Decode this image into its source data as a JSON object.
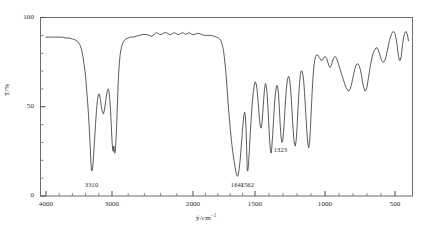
{
  "figure": {
    "type": "ir-spectrum",
    "background": "#ffffff",
    "line_color": "#4a4a4a"
  },
  "axes": {
    "y_title": "T/%",
    "x_title_symbol": "ỹ/cm",
    "x_title_exponent": "−1",
    "x_ticks": [
      "4000",
      "3000",
      "2000",
      "1500",
      "1000",
      "500"
    ],
    "y_ticks": [
      "100",
      "50",
      "0"
    ]
  },
  "peak_labels": [
    {
      "text": "3310"
    },
    {
      "text": "1641"
    },
    {
      "text": "1562"
    },
    {
      "text": "1323"
    }
  ],
  "chart_data": {
    "type": "line",
    "title": "",
    "xlabel": "ỹ/cm⁻¹",
    "ylabel": "T/%",
    "xlim": [
      4000,
      400
    ],
    "ylim": [
      0,
      100
    ],
    "grid": false,
    "legend": null,
    "x_axis_scale": "piecewise-linear (compressed above 2000 cm-1)",
    "x_axis_breakpoints": [
      {
        "wavenumber": 4000,
        "px": 46
      },
      {
        "wavenumber": 3000,
        "px": 112
      },
      {
        "wavenumber": 2000,
        "px": 193
      },
      {
        "wavenumber": 1500,
        "px": 255
      },
      {
        "wavenumber": 1000,
        "px": 325
      },
      {
        "wavenumber": 500,
        "px": 395
      }
    ],
    "annotations": [
      {
        "label": "3310",
        "wavenumber": 3310,
        "transmittance": 14
      },
      {
        "label": "1641",
        "wavenumber": 1641,
        "transmittance": 11
      },
      {
        "label": "1562",
        "wavenumber": 1562,
        "transmittance": 14
      },
      {
        "label": "1323",
        "wavenumber": 1323,
        "transmittance": 30
      }
    ],
    "series": [
      {
        "name": "transmittance",
        "points": [
          [
            4000,
            89
          ],
          [
            3960,
            89
          ],
          [
            3900,
            89
          ],
          [
            3850,
            89
          ],
          [
            3800,
            89
          ],
          [
            3750,
            89
          ],
          [
            3700,
            88.5
          ],
          [
            3650,
            88.5
          ],
          [
            3600,
            88
          ],
          [
            3560,
            87.5
          ],
          [
            3520,
            86.5
          ],
          [
            3490,
            85
          ],
          [
            3460,
            82
          ],
          [
            3440,
            78
          ],
          [
            3420,
            73
          ],
          [
            3400,
            67
          ],
          [
            3385,
            60
          ],
          [
            3370,
            53
          ],
          [
            3355,
            45
          ],
          [
            3340,
            35
          ],
          [
            3328,
            26
          ],
          [
            3318,
            18
          ],
          [
            3310,
            14
          ],
          [
            3300,
            14.5
          ],
          [
            3290,
            17
          ],
          [
            3278,
            23
          ],
          [
            3265,
            31
          ],
          [
            3250,
            40
          ],
          [
            3235,
            48
          ],
          [
            3220,
            54
          ],
          [
            3205,
            57
          ],
          [
            3190,
            57
          ],
          [
            3175,
            54
          ],
          [
            3160,
            50
          ],
          [
            3145,
            47
          ],
          [
            3130,
            46
          ],
          [
            3115,
            48
          ],
          [
            3100,
            52
          ],
          [
            3085,
            56
          ],
          [
            3070,
            59
          ],
          [
            3058,
            60
          ],
          [
            3048,
            59
          ],
          [
            3035,
            55
          ],
          [
            3022,
            48
          ],
          [
            3010,
            39
          ],
          [
            3000,
            31
          ],
          [
            2992,
            26
          ],
          [
            2985,
            25
          ],
          [
            2978,
            28
          ],
          [
            2972,
            26
          ],
          [
            2966,
            24
          ],
          [
            2960,
            25
          ],
          [
            2952,
            30
          ],
          [
            2944,
            38
          ],
          [
            2936,
            48
          ],
          [
            2928,
            58
          ],
          [
            2920,
            67
          ],
          [
            2910,
            74
          ],
          [
            2900,
            79
          ],
          [
            2885,
            83
          ],
          [
            2870,
            85.5
          ],
          [
            2850,
            87
          ],
          [
            2830,
            88
          ],
          [
            2800,
            88.5
          ],
          [
            2770,
            89
          ],
          [
            2740,
            89
          ],
          [
            2700,
            89.5
          ],
          [
            2660,
            90
          ],
          [
            2620,
            90.5
          ],
          [
            2580,
            90.5
          ],
          [
            2540,
            90
          ],
          [
            2510,
            89.5
          ],
          [
            2490,
            90
          ],
          [
            2470,
            91
          ],
          [
            2450,
            91.5
          ],
          [
            2430,
            91
          ],
          [
            2410,
            90.5
          ],
          [
            2390,
            90.5
          ],
          [
            2370,
            91
          ],
          [
            2350,
            91.5
          ],
          [
            2330,
            91.5
          ],
          [
            2310,
            91
          ],
          [
            2290,
            90.5
          ],
          [
            2270,
            90.5
          ],
          [
            2250,
            91
          ],
          [
            2230,
            91.5
          ],
          [
            2210,
            91
          ],
          [
            2190,
            90.5
          ],
          [
            2170,
            90.5
          ],
          [
            2150,
            91
          ],
          [
            2130,
            91.5
          ],
          [
            2110,
            91
          ],
          [
            2090,
            90.5
          ],
          [
            2070,
            91
          ],
          [
            2050,
            91.5
          ],
          [
            2030,
            91
          ],
          [
            2010,
            90.5
          ],
          [
            1990,
            90.5
          ],
          [
            1970,
            91
          ],
          [
            1950,
            91
          ],
          [
            1930,
            90.5
          ],
          [
            1910,
            90
          ],
          [
            1890,
            90
          ],
          [
            1870,
            90
          ],
          [
            1850,
            90
          ],
          [
            1830,
            89.5
          ],
          [
            1810,
            89
          ],
          [
            1795,
            88.5
          ],
          [
            1785,
            88
          ],
          [
            1775,
            87
          ],
          [
            1765,
            85
          ],
          [
            1755,
            82
          ],
          [
            1748,
            78
          ],
          [
            1740,
            73
          ],
          [
            1732,
            67
          ],
          [
            1725,
            60
          ],
          [
            1718,
            53
          ],
          [
            1710,
            46
          ],
          [
            1700,
            38
          ],
          [
            1690,
            31
          ],
          [
            1680,
            25
          ],
          [
            1670,
            20
          ],
          [
            1660,
            16
          ],
          [
            1652,
            13
          ],
          [
            1645,
            11.5
          ],
          [
            1641,
            11
          ],
          [
            1635,
            12
          ],
          [
            1628,
            15
          ],
          [
            1620,
            20
          ],
          [
            1612,
            27
          ],
          [
            1604,
            34
          ],
          [
            1596,
            41
          ],
          [
            1590,
            45
          ],
          [
            1584,
            47
          ],
          [
            1578,
            45
          ],
          [
            1572,
            38
          ],
          [
            1568,
            28
          ],
          [
            1564,
            19
          ],
          [
            1562,
            14
          ],
          [
            1558,
            14
          ],
          [
            1552,
            18
          ],
          [
            1545,
            26
          ],
          [
            1538,
            35
          ],
          [
            1530,
            44
          ],
          [
            1522,
            52
          ],
          [
            1514,
            58
          ],
          [
            1506,
            62
          ],
          [
            1498,
            64
          ],
          [
            1492,
            63
          ],
          [
            1486,
            60
          ],
          [
            1480,
            55
          ],
          [
            1474,
            49
          ],
          [
            1468,
            43
          ],
          [
            1462,
            39
          ],
          [
            1456,
            38
          ],
          [
            1450,
            41
          ],
          [
            1444,
            47
          ],
          [
            1438,
            54
          ],
          [
            1432,
            60
          ],
          [
            1426,
            63
          ],
          [
            1420,
            62
          ],
          [
            1414,
            58
          ],
          [
            1408,
            50
          ],
          [
            1402,
            41
          ],
          [
            1396,
            32
          ],
          [
            1390,
            26
          ],
          [
            1385,
            24
          ],
          [
            1380,
            27
          ],
          [
            1374,
            34
          ],
          [
            1368,
            42
          ],
          [
            1362,
            50
          ],
          [
            1356,
            56
          ],
          [
            1350,
            60
          ],
          [
            1344,
            62
          ],
          [
            1338,
            61
          ],
          [
            1332,
            57
          ],
          [
            1326,
            49
          ],
          [
            1320,
            40
          ],
          [
            1314,
            33
          ],
          [
            1308,
            30
          ],
          [
            1302,
            31
          ],
          [
            1296,
            36
          ],
          [
            1290,
            43
          ],
          [
            1284,
            51
          ],
          [
            1278,
            58
          ],
          [
            1272,
            63
          ],
          [
            1266,
            66
          ],
          [
            1260,
            67
          ],
          [
            1254,
            66
          ],
          [
            1248,
            62
          ],
          [
            1242,
            56
          ],
          [
            1236,
            48
          ],
          [
            1230,
            40
          ],
          [
            1224,
            33
          ],
          [
            1218,
            29
          ],
          [
            1212,
            28
          ],
          [
            1206,
            31
          ],
          [
            1200,
            38
          ],
          [
            1194,
            47
          ],
          [
            1188,
            56
          ],
          [
            1182,
            63
          ],
          [
            1176,
            68
          ],
          [
            1170,
            70
          ],
          [
            1164,
            70
          ],
          [
            1158,
            68
          ],
          [
            1152,
            64
          ],
          [
            1146,
            58
          ],
          [
            1140,
            50
          ],
          [
            1134,
            42
          ],
          [
            1128,
            34
          ],
          [
            1122,
            29
          ],
          [
            1116,
            27
          ],
          [
            1110,
            30
          ],
          [
            1104,
            38
          ],
          [
            1098,
            48
          ],
          [
            1092,
            58
          ],
          [
            1086,
            66
          ],
          [
            1080,
            72
          ],
          [
            1074,
            76
          ],
          [
            1068,
            78
          ],
          [
            1060,
            79
          ],
          [
            1052,
            79
          ],
          [
            1044,
            78
          ],
          [
            1036,
            77
          ],
          [
            1028,
            76
          ],
          [
            1020,
            76
          ],
          [
            1012,
            77
          ],
          [
            1004,
            78
          ],
          [
            996,
            78
          ],
          [
            988,
            77
          ],
          [
            980,
            75
          ],
          [
            972,
            73
          ],
          [
            964,
            72
          ],
          [
            956,
            73
          ],
          [
            948,
            75
          ],
          [
            940,
            77
          ],
          [
            932,
            78
          ],
          [
            924,
            78
          ],
          [
            916,
            77
          ],
          [
            908,
            75
          ],
          [
            900,
            73
          ],
          [
            892,
            71
          ],
          [
            884,
            69
          ],
          [
            876,
            67
          ],
          [
            868,
            65
          ],
          [
            860,
            63
          ],
          [
            852,
            61
          ],
          [
            844,
            60
          ],
          [
            836,
            59
          ],
          [
            828,
            59
          ],
          [
            820,
            60
          ],
          [
            812,
            62
          ],
          [
            804,
            65
          ],
          [
            796,
            68
          ],
          [
            788,
            71
          ],
          [
            780,
            73
          ],
          [
            772,
            74
          ],
          [
            764,
            74
          ],
          [
            756,
            73
          ],
          [
            748,
            71
          ],
          [
            740,
            68
          ],
          [
            732,
            64
          ],
          [
            724,
            61
          ],
          [
            716,
            59
          ],
          [
            708,
            59
          ],
          [
            700,
            61
          ],
          [
            692,
            65
          ],
          [
            684,
            69
          ],
          [
            676,
            73
          ],
          [
            668,
            76
          ],
          [
            660,
            79
          ],
          [
            652,
            81
          ],
          [
            644,
            82
          ],
          [
            636,
            83
          ],
          [
            628,
            83
          ],
          [
            620,
            82
          ],
          [
            612,
            80
          ],
          [
            604,
            78
          ],
          [
            596,
            76
          ],
          [
            588,
            75
          ],
          [
            580,
            75
          ],
          [
            572,
            76
          ],
          [
            564,
            78
          ],
          [
            556,
            81
          ],
          [
            548,
            84
          ],
          [
            540,
            87
          ],
          [
            532,
            89
          ],
          [
            524,
            91
          ],
          [
            516,
            92
          ],
          [
            508,
            92
          ],
          [
            500,
            91
          ],
          [
            492,
            88
          ],
          [
            486,
            85
          ],
          [
            480,
            81
          ],
          [
            474,
            78
          ],
          [
            468,
            76
          ],
          [
            462,
            76
          ],
          [
            456,
            78
          ],
          [
            450,
            82
          ],
          [
            444,
            86
          ],
          [
            438,
            89
          ],
          [
            432,
            91
          ],
          [
            426,
            92
          ],
          [
            420,
            92
          ],
          [
            414,
            91
          ],
          [
            408,
            89
          ],
          [
            404,
            87
          ]
        ]
      }
    ]
  }
}
